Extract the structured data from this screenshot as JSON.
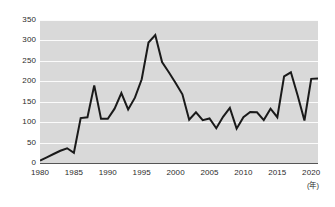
{
  "chart_data": {
    "type": "line",
    "title": "",
    "subtitle": "",
    "xlabel": "(年)",
    "ylabel": "",
    "xlim": [
      1980,
      2021
    ],
    "ylim": [
      0,
      350
    ],
    "grid": true,
    "legend": "none",
    "line_color": "#1a1a1a",
    "plot_background": "#d9d9d9",
    "gridline_color": "#fbfbfb",
    "axis_color": "#555555",
    "y_ticks": [
      0,
      50,
      100,
      150,
      200,
      250,
      300,
      350
    ],
    "y_tick_labels": [
      "0",
      "50",
      "100",
      "150",
      "200",
      "250",
      "300",
      "350"
    ],
    "x_ticks": [
      1980,
      1985,
      1990,
      1995,
      2000,
      2005,
      2010,
      2015,
      2020
    ],
    "x_tick_labels": [
      "1980",
      "1985",
      "1990",
      "1995",
      "2000",
      "2005",
      "2010",
      "2015",
      "2020"
    ],
    "x": [
      1980,
      1981,
      1982,
      1983,
      1984,
      1985,
      1986,
      1987,
      1988,
      1989,
      1990,
      1991,
      1992,
      1993,
      1994,
      1995,
      1996,
      1997,
      1998,
      1999,
      2000,
      2001,
      2002,
      2003,
      2004,
      2005,
      2006,
      2007,
      2008,
      2009,
      2010,
      2011,
      2012,
      2013,
      2014,
      2015,
      2016,
      2017,
      2018,
      2019,
      2020,
      2021
    ],
    "series": [
      {
        "name": "value",
        "values": [
          6,
          14,
          22,
          30,
          36,
          25,
          110,
          112,
          190,
          108,
          108,
          133,
          171,
          131,
          160,
          205,
          295,
          313,
          247,
          222,
          196,
          168,
          106,
          124,
          105,
          109,
          85,
          113,
          135,
          84,
          112,
          125,
          124,
          105,
          133,
          112,
          212,
          222,
          165,
          104,
          206,
          207
        ]
      }
    ]
  }
}
